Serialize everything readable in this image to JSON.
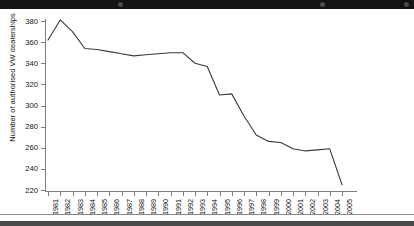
{
  "chart_data": {
    "type": "line",
    "title": "",
    "xlabel": "",
    "ylabel": "Number of authorised VW dealerships",
    "categories": [
      "1981",
      "1982",
      "1983",
      "1984",
      "1985",
      "1986",
      "1987",
      "1988",
      "1989",
      "1990",
      "1991",
      "1992",
      "1993",
      "1994",
      "1995",
      "1996",
      "1997",
      "1998",
      "1999",
      "2000",
      "2001",
      "2002",
      "2003",
      "2004",
      "2005"
    ],
    "values": [
      362,
      381,
      370,
      354,
      353,
      351,
      349,
      347,
      348,
      349,
      350,
      350,
      340,
      337,
      310,
      311,
      290,
      272,
      266,
      265,
      259,
      257,
      258,
      259,
      225
    ],
    "series": [
      {
        "name": "Number of authorised VW dealerships",
        "values": [
          362,
          381,
          370,
          354,
          353,
          351,
          349,
          347,
          348,
          349,
          350,
          350,
          340,
          337,
          310,
          311,
          290,
          272,
          266,
          265,
          259,
          257,
          258,
          259,
          225
        ]
      }
    ],
    "ylim": [
      220,
      380
    ],
    "yticks": [
      220,
      240,
      260,
      280,
      300,
      320,
      340,
      360,
      380
    ],
    "ytick_labels": [
      "220",
      "240",
      "260",
      "280",
      "300",
      "320",
      "340",
      "360",
      "380"
    ],
    "grid": false,
    "legend": "none",
    "line_color": "#3a3a3a",
    "axis_color": "#7d7d7d",
    "background": "#ffffff"
  },
  "window": {
    "topbar_color": "#131313",
    "bottombar_color": "#4a4a4a"
  }
}
